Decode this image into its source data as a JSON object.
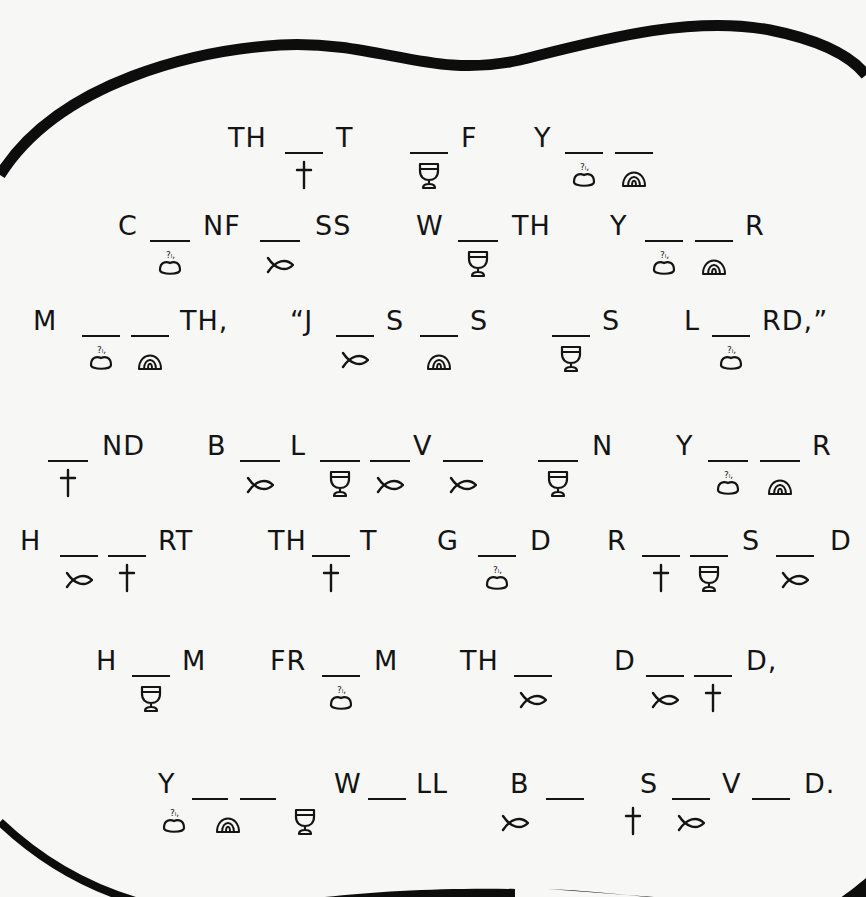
{
  "puzzle": {
    "title": "",
    "legend": {
      "cross": "cross-icon",
      "chalice": "chalice-icon",
      "bread": "bread-icon",
      "rainbow": "rainbow-icon",
      "fish": "fish-icon"
    },
    "rows": [
      {
        "items": [
          {
            "t": "text",
            "v": "TH",
            "x": 228
          },
          {
            "t": "blank",
            "x": 285,
            "w": 38,
            "sym": "cross"
          },
          {
            "t": "text",
            "v": "T",
            "x": 336
          },
          {
            "t": "blank",
            "x": 410,
            "w": 38,
            "sym": "chalice"
          },
          {
            "t": "text",
            "v": "F",
            "x": 461
          },
          {
            "t": "text",
            "v": "Y",
            "x": 534
          },
          {
            "t": "blank",
            "x": 565,
            "w": 38,
            "sym": "bread"
          },
          {
            "t": "blank",
            "x": 615,
            "w": 38,
            "sym": "rainbow"
          }
        ]
      },
      {
        "items": [
          {
            "t": "text",
            "v": "C",
            "x": 118
          },
          {
            "t": "blank",
            "x": 150,
            "w": 40,
            "sym": "bread"
          },
          {
            "t": "text",
            "v": "NF",
            "x": 203
          },
          {
            "t": "blank",
            "x": 260,
            "w": 40,
            "sym": "fish"
          },
          {
            "t": "text",
            "v": "SS",
            "x": 315
          },
          {
            "t": "text",
            "v": "W",
            "x": 416
          },
          {
            "t": "blank",
            "x": 458,
            "w": 40,
            "sym": "chalice"
          },
          {
            "t": "text",
            "v": "TH",
            "x": 512
          },
          {
            "t": "text",
            "v": "Y",
            "x": 610
          },
          {
            "t": "blank",
            "x": 645,
            "w": 38,
            "sym": "bread"
          },
          {
            "t": "blank",
            "x": 695,
            "w": 38,
            "sym": "rainbow"
          },
          {
            "t": "text",
            "v": "R",
            "x": 745
          }
        ]
      },
      {
        "items": [
          {
            "t": "text",
            "v": "M",
            "x": 33
          },
          {
            "t": "blank",
            "x": 82,
            "w": 38,
            "sym": "bread"
          },
          {
            "t": "blank",
            "x": 131,
            "w": 38,
            "sym": "rainbow"
          },
          {
            "t": "text",
            "v": "TH,",
            "x": 180
          },
          {
            "t": "text",
            "v": "“J",
            "x": 290
          },
          {
            "t": "blank",
            "x": 336,
            "w": 38,
            "sym": "fish"
          },
          {
            "t": "text",
            "v": "S",
            "x": 386
          },
          {
            "t": "blank",
            "x": 420,
            "w": 38,
            "sym": "rainbow"
          },
          {
            "t": "text",
            "v": "S",
            "x": 470
          },
          {
            "t": "blank",
            "x": 552,
            "w": 38,
            "sym": "chalice"
          },
          {
            "t": "text",
            "v": "S",
            "x": 602
          },
          {
            "t": "text",
            "v": "L",
            "x": 684
          },
          {
            "t": "blank",
            "x": 712,
            "w": 38,
            "sym": "bread"
          },
          {
            "t": "text",
            "v": "RD,”",
            "x": 762
          }
        ]
      },
      {
        "items": [
          {
            "t": "blank",
            "x": 48,
            "w": 40,
            "sym": "cross"
          },
          {
            "t": "text",
            "v": "ND",
            "x": 102
          },
          {
            "t": "text",
            "v": "B",
            "x": 207
          },
          {
            "t": "blank",
            "x": 240,
            "w": 40,
            "sym": "fish"
          },
          {
            "t": "text",
            "v": "L",
            "x": 290
          },
          {
            "t": "blank",
            "x": 320,
            "w": 40,
            "sym": "chalice"
          },
          {
            "t": "blank",
            "x": 370,
            "w": 40,
            "sym": "fish"
          },
          {
            "t": "text",
            "v": "V",
            "x": 413
          },
          {
            "t": "blank",
            "x": 443,
            "w": 40,
            "sym": "fish"
          },
          {
            "t": "blank",
            "x": 538,
            "w": 40,
            "sym": "chalice"
          },
          {
            "t": "text",
            "v": "N",
            "x": 592
          },
          {
            "t": "text",
            "v": "Y",
            "x": 676
          },
          {
            "t": "blank",
            "x": 708,
            "w": 40,
            "sym": "bread"
          },
          {
            "t": "blank",
            "x": 760,
            "w": 40,
            "sym": "rainbow"
          },
          {
            "t": "text",
            "v": "R",
            "x": 812
          }
        ]
      },
      {
        "items": [
          {
            "t": "text",
            "v": "H",
            "x": 20
          },
          {
            "t": "blank",
            "x": 60,
            "w": 38,
            "sym": "fish"
          },
          {
            "t": "blank",
            "x": 108,
            "w": 38,
            "sym": "cross"
          },
          {
            "t": "text",
            "v": "RT",
            "x": 158
          },
          {
            "t": "text",
            "v": "TH",
            "x": 268
          },
          {
            "t": "blank",
            "x": 312,
            "w": 38,
            "sym": "cross"
          },
          {
            "t": "text",
            "v": "T",
            "x": 360
          },
          {
            "t": "text",
            "v": "G",
            "x": 437
          },
          {
            "t": "blank",
            "x": 478,
            "w": 38,
            "sym": "bread"
          },
          {
            "t": "text",
            "v": "D",
            "x": 530
          },
          {
            "t": "text",
            "v": "R",
            "x": 607
          },
          {
            "t": "blank",
            "x": 642,
            "w": 38,
            "sym": "cross"
          },
          {
            "t": "blank",
            "x": 690,
            "w": 38,
            "sym": "chalice"
          },
          {
            "t": "text",
            "v": "S",
            "x": 742
          },
          {
            "t": "blank",
            "x": 776,
            "w": 38,
            "sym": "fish"
          },
          {
            "t": "text",
            "v": "D",
            "x": 830
          }
        ]
      },
      {
        "items": [
          {
            "t": "text",
            "v": "H",
            "x": 96
          },
          {
            "t": "blank",
            "x": 132,
            "w": 38,
            "sym": "chalice"
          },
          {
            "t": "text",
            "v": "M",
            "x": 182
          },
          {
            "t": "text",
            "v": "FR",
            "x": 270
          },
          {
            "t": "blank",
            "x": 322,
            "w": 38,
            "sym": "bread"
          },
          {
            "t": "text",
            "v": "M",
            "x": 374
          },
          {
            "t": "text",
            "v": "TH",
            "x": 460
          },
          {
            "t": "blank",
            "x": 514,
            "w": 38,
            "sym": "fish"
          },
          {
            "t": "text",
            "v": "D",
            "x": 614
          },
          {
            "t": "blank",
            "x": 646,
            "w": 38,
            "sym": "fish"
          },
          {
            "t": "blank",
            "x": 694,
            "w": 38,
            "sym": "cross"
          },
          {
            "t": "text",
            "v": "D,",
            "x": 746
          }
        ]
      },
      {
        "items": [
          {
            "t": "text",
            "v": "Y",
            "x": 158
          },
          {
            "t": "blank",
            "x": 192,
            "w": 36,
            "sym": "bread",
            "symdx": -36
          },
          {
            "t": "blank",
            "x": 240,
            "w": 36,
            "sym": "rainbow",
            "symdx": -30
          },
          {
            "t": "text",
            "v": "W",
            "x": 334
          },
          {
            "t": "blank",
            "x": 368,
            "w": 38,
            "sym": "chalice",
            "symdx": -82
          },
          {
            "t": "text",
            "v": "LL",
            "x": 416
          },
          {
            "t": "text",
            "v": "B",
            "x": 510
          },
          {
            "t": "blank",
            "x": 546,
            "w": 38,
            "sym": "fish",
            "symdx": -50
          },
          {
            "t": "text",
            "v": "S",
            "x": 640
          },
          {
            "t": "blank",
            "x": 672,
            "w": 38,
            "sym": "fish"
          },
          {
            "t": "text",
            "v": "V",
            "x": 722
          },
          {
            "t": "blank",
            "x": 752,
            "w": 38,
            "sym": "cross",
            "symdx": -138
          },
          {
            "t": "text",
            "v": "D.",
            "x": 804
          }
        ]
      }
    ]
  }
}
